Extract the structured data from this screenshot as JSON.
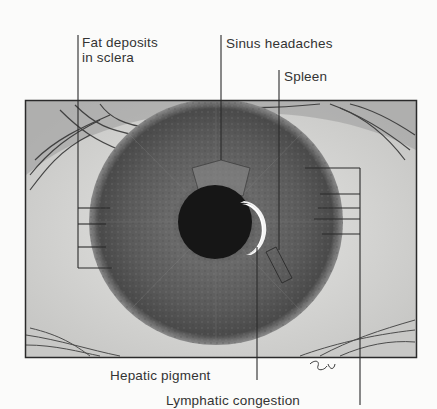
{
  "diagram": {
    "labels": {
      "fat_deposits_line1": "Fat deposits",
      "fat_deposits_line2": "in sclera",
      "sinus_headaches": "Sinus headaches",
      "spleen": "Spleen",
      "hepatic_pigment": "Hepatic pigment",
      "lymphatic_congestion": "Lymphatic congestion"
    },
    "colors": {
      "line": "#2a2a2a",
      "text": "#333333",
      "sclera": "#d8d8d6",
      "iris": "#5a5a5a",
      "pupil": "#151515",
      "highlight": "#ffffff",
      "background": "#fbfbfa"
    }
  }
}
